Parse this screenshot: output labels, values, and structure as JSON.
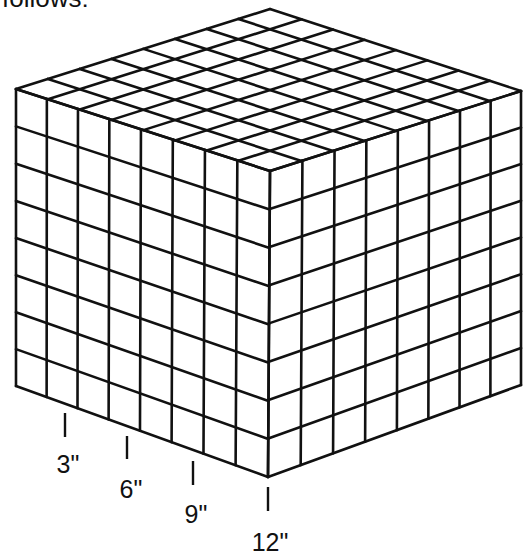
{
  "caption_partial": "follows:",
  "figure": {
    "type": "cube",
    "grid_divisions": 8,
    "stroke_color": "#111111",
    "background": "#ffffff",
    "edge_length_inches": 12,
    "measure_labels": [
      "3\"",
      "6\"",
      "9\"",
      "12\""
    ],
    "measure_values": [
      3,
      6,
      9,
      12
    ]
  }
}
